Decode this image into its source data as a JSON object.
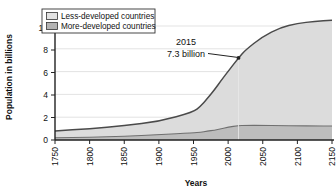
{
  "chart_data": {
    "type": "area",
    "title": "",
    "xlabel": "Years",
    "ylabel": "Population in billions",
    "xlim": [
      1750,
      2150
    ],
    "ylim": [
      0,
      11.2
    ],
    "grid": "horizontal",
    "legend_position": "top-left",
    "stacked": true,
    "x": [
      1750,
      1800,
      1850,
      1900,
      1950,
      1960,
      1970,
      1980,
      1990,
      2000,
      2015,
      2025,
      2050,
      2075,
      2100,
      2125,
      2150
    ],
    "series": [
      {
        "name": "More-developed countries",
        "color": "#bdbdbd",
        "line_color": "#6b6b6b",
        "values": [
          0.2,
          0.25,
          0.33,
          0.47,
          0.63,
          0.7,
          0.78,
          0.88,
          1.0,
          1.15,
          1.27,
          1.3,
          1.3,
          1.28,
          1.26,
          1.25,
          1.25
        ]
      },
      {
        "name": "Less-developed countries",
        "color": "#dcdcdc",
        "line_color": "#4a4a4a",
        "values": [
          0.6,
          0.76,
          0.94,
          1.18,
          1.87,
          2.3,
          2.9,
          3.56,
          4.3,
          4.95,
          6.03,
          6.7,
          7.9,
          8.7,
          9.1,
          9.3,
          9.4
        ]
      }
    ],
    "totals": [
      0.8,
      1.01,
      1.27,
      1.65,
      2.5,
      3.0,
      3.68,
      4.44,
      5.3,
      6.1,
      7.3,
      8.0,
      9.2,
      9.98,
      10.36,
      10.55,
      10.65
    ],
    "x_ticks": [
      "1750",
      "1800",
      "1850",
      "1900",
      "1950",
      "2000",
      "2050",
      "2100",
      "2150"
    ],
    "y_ticks": [
      "0",
      "2",
      "4",
      "6",
      "8",
      "10"
    ],
    "annotations": [
      {
        "name": "population-2015-callout",
        "line1": "2015",
        "line2": "7.3 billion",
        "x": 2015,
        "y": 7.3
      }
    ]
  },
  "legend": {
    "items": [
      {
        "label": "Less-developed countries",
        "swatch": "#e2e2e2"
      },
      {
        "label": "More-developed countries",
        "swatch": "#b4b4b4"
      }
    ]
  }
}
